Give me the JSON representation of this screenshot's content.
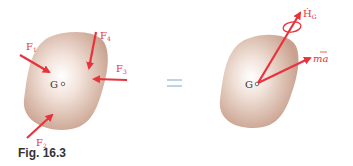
{
  "figure": {
    "caption": "Fig. 16.3",
    "equals_sign": "=",
    "colors": {
      "arrow": "#e8323c",
      "body": "#d9b8a6",
      "equals": "#a8c4e0",
      "label_text": "#333333"
    },
    "left_body": {
      "center_label": "G",
      "forces": [
        {
          "name": "F1",
          "label": "F",
          "sub": "1"
        },
        {
          "name": "F2",
          "label": "F",
          "sub": "2"
        },
        {
          "name": "F3",
          "label": "F",
          "sub": "3"
        },
        {
          "name": "F4",
          "label": "F",
          "sub": "4"
        }
      ]
    },
    "right_body": {
      "center_label": "G",
      "angular_momentum_rate": {
        "label": "Ḣ",
        "sub": "G"
      },
      "effective_force": {
        "label": "ma",
        "overbar": true
      }
    }
  }
}
